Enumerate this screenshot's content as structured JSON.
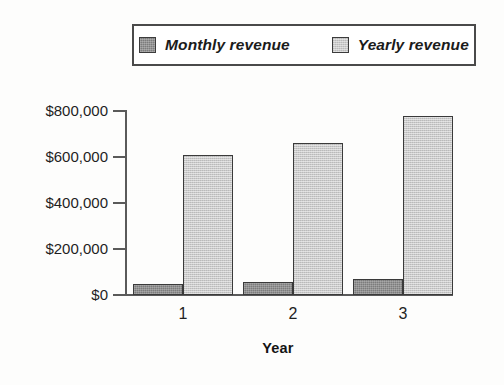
{
  "chart_data": {
    "type": "bar",
    "title": "",
    "subtitle": "",
    "xlabel": "Year",
    "ylabel": "",
    "categories": [
      "1",
      "2",
      "3"
    ],
    "series": [
      {
        "name": "Monthly revenue",
        "color": "#7c7c7c",
        "values": [
          50000,
          57000,
          70000
        ]
      },
      {
        "name": "Yearly revenue",
        "color": "#cacaca",
        "values": [
          610000,
          660000,
          780000
        ]
      }
    ],
    "ylim": [
      0,
      800000
    ],
    "ytick_values": [
      0,
      200000,
      400000,
      600000,
      800000
    ],
    "ytick_labels": [
      "$0",
      "$200,000",
      "$400,000",
      "$600,000",
      "$800,000"
    ],
    "xtick_labels": [
      "1",
      "2",
      "3"
    ],
    "grid": false,
    "legend_position": "top-center",
    "legend_entries": [
      "Monthly revenue",
      "Yearly revenue"
    ]
  },
  "legend": {
    "entries": [
      {
        "label": "Monthly revenue",
        "swatch": "monthly-revenue-swatch"
      },
      {
        "label": "Yearly revenue",
        "swatch": "yearly-revenue-swatch"
      }
    ]
  },
  "axes": {
    "y_labels": [
      "$800,000",
      "$600,000",
      "$400,000",
      "$200,000",
      "$0"
    ],
    "x_labels": [
      "1",
      "2",
      "3"
    ],
    "x_title": "Year"
  }
}
